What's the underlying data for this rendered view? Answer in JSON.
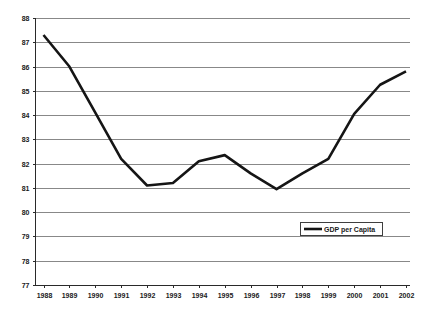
{
  "chart_data": {
    "type": "line",
    "title": "",
    "subtitle": "",
    "xlabel": "",
    "ylabel": "",
    "categories": [
      "1988",
      "1989",
      "1990",
      "1991",
      "1992",
      "1993",
      "1994",
      "1995",
      "1996",
      "1997",
      "1998",
      "1999",
      "2000",
      "2001",
      "2002"
    ],
    "series": [
      {
        "name": "GDP per Capita",
        "color": "#151515",
        "values": [
          87.3,
          86.0,
          84.1,
          82.2,
          81.1,
          81.2,
          82.1,
          82.35,
          81.6,
          80.95,
          81.6,
          82.2,
          84.05,
          85.25,
          85.8
        ]
      }
    ],
    "ylim": [
      77,
      88
    ],
    "ytick_labels": [
      "88",
      "87",
      "86",
      "85",
      "84",
      "83",
      "82",
      "81",
      "80",
      "79",
      "78",
      "77"
    ],
    "ytick_values": [
      88,
      87,
      86,
      85,
      84,
      83,
      82,
      81,
      80,
      79,
      78,
      77
    ],
    "grid": true,
    "grid_axis": "y",
    "legend": {
      "position": "inside-right",
      "entries": [
        "GDP per Capita"
      ]
    }
  }
}
